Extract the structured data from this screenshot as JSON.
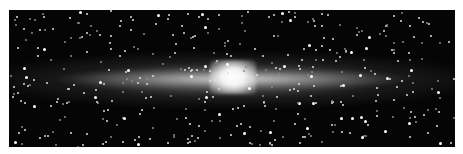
{
  "image": {
    "subject": "edge-on spiral galaxy (infrared view of galactic disk)",
    "description": "Dark starfield with a bright horizontal dust/star band and a glowing central bulge",
    "colors": {
      "background": "#050505",
      "band": "#c8c8c8",
      "core": "#ffffff",
      "page": "#ffffff"
    }
  }
}
